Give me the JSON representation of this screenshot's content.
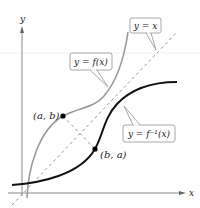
{
  "axes": {
    "x_label": "x",
    "y_label": "y"
  },
  "curves": {
    "f": {
      "label": "y = f(x)",
      "color": "#9a9a9a"
    },
    "f_inverse": {
      "label": "y = f⁻¹(x)",
      "color": "#111111"
    },
    "identity": {
      "label": "y = x",
      "color": "#9a9a9a"
    }
  },
  "points": [
    {
      "label": "(a, b)"
    },
    {
      "label": "(b, a)"
    }
  ],
  "colors": {
    "axis": "#8a8a8a",
    "callout_border": "#a8a8a8",
    "point": "#000000"
  }
}
